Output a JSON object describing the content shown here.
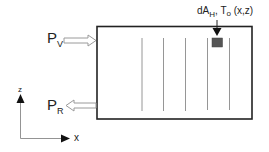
{
  "diagram": {
    "inlet": {
      "symbol": "P",
      "subscript": "V",
      "direction": "in"
    },
    "outlet": {
      "symbol": "P",
      "subscript": "R",
      "direction": "out"
    },
    "element_label": {
      "main": "dA",
      "subscript": "H",
      "rest": ", T",
      "rest_sub": "o",
      "coords": " (x,z)"
    },
    "axes": {
      "vertical": "z",
      "horizontal": "x"
    },
    "channel_lines": 5,
    "colors": {
      "stroke": "#222222",
      "lines": "#8a8a8a",
      "element": "#555555",
      "arrow_fill": "#ffffff",
      "arrow_stroke": "#9a9a9a"
    }
  }
}
